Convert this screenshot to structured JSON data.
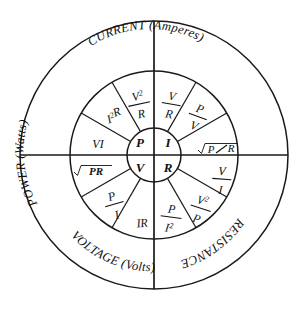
{
  "diagram": {
    "background_color": "#ffffff",
    "line_color": "#1a1a1a",
    "center": {
      "x": 154,
      "y": 155
    },
    "radii": {
      "outer": 134,
      "middle": 84,
      "hub": 27
    },
    "hub": {
      "top_left": "P",
      "top_right": "I",
      "bottom_left": "V",
      "bottom_right": "R"
    },
    "quadrants": [
      {
        "id": "power",
        "label": "POWER (Watts)",
        "label_name": "POWER",
        "label_unit": "(Watts)",
        "center_symbol": "P",
        "position": "upper-left",
        "formulas": [
          {
            "display": "VI",
            "numerator": "VI",
            "denominator": "",
            "kind": "plain"
          },
          {
            "display": "I2R",
            "numerator": "I²R",
            "denominator": "",
            "kind": "power"
          },
          {
            "display": "V2/R",
            "numerator": "V²",
            "denominator": "R",
            "kind": "fraction"
          }
        ]
      },
      {
        "id": "current",
        "label": "CURRENT (Amperes)",
        "label_name": "CURRENT",
        "label_unit": "(Amperes)",
        "center_symbol": "I",
        "position": "upper-right",
        "formulas": [
          {
            "display": "V/R",
            "numerator": "V",
            "denominator": "R",
            "kind": "fraction"
          },
          {
            "display": "P/V",
            "numerator": "P",
            "denominator": "V",
            "kind": "fraction"
          },
          {
            "display": "sqrt(P/R)",
            "numerator": "P",
            "denominator": "R",
            "kind": "radical-fraction"
          }
        ]
      },
      {
        "id": "voltage",
        "label": "VOLTAGE (Volts)",
        "label_name": "VOLTAGE",
        "label_unit": "(Volts)",
        "center_symbol": "V",
        "position": "lower-left",
        "formulas": [
          {
            "display": "sqrt(PR)",
            "numerator": "PR",
            "denominator": "",
            "kind": "radical"
          },
          {
            "display": "P/I",
            "numerator": "P",
            "denominator": "I",
            "kind": "fraction"
          },
          {
            "display": "IR",
            "numerator": "IR",
            "denominator": "",
            "kind": "plain"
          }
        ]
      },
      {
        "id": "resistance",
        "label": "RESISTANCE (Ohms)",
        "label_name": "RESISTANCE",
        "label_unit": "(Ohms)",
        "center_symbol": "R",
        "position": "lower-right",
        "formulas": [
          {
            "display": "P/I2",
            "numerator": "P",
            "denominator": "I²",
            "kind": "fraction-power-den"
          },
          {
            "display": "V2/P",
            "numerator": "V²",
            "denominator": "P",
            "kind": "fraction-power-num"
          },
          {
            "display": "V/I",
            "numerator": "V",
            "denominator": "I",
            "kind": "fraction"
          }
        ]
      }
    ]
  }
}
